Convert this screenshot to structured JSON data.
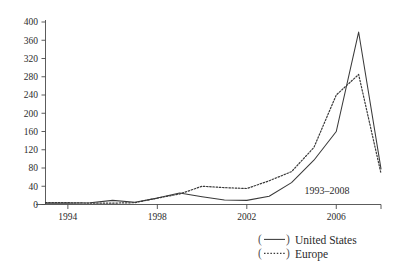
{
  "chart_data": {
    "type": "line",
    "title": "",
    "subtitle": "",
    "xlabel": "",
    "ylabel": "",
    "annotation": "1993–2008",
    "xlim": [
      1993,
      2008
    ],
    "ylim": [
      0,
      400
    ],
    "grid": false,
    "legend_position": "bottom-right",
    "x": [
      1993,
      1994,
      1995,
      1996,
      1997,
      1998,
      1999,
      2000,
      2001,
      2002,
      2003,
      2004,
      2005,
      2006,
      2007,
      2008
    ],
    "xticks": [
      1994,
      1998,
      2002,
      2006
    ],
    "xtick_labels": [
      "1994",
      "1998",
      "2002",
      "2006"
    ],
    "yticks": [
      0,
      40,
      80,
      120,
      160,
      200,
      240,
      280,
      320,
      360,
      400
    ],
    "ytick_labels": [
      "0",
      "40",
      "80",
      "120",
      "160",
      "200",
      "240",
      "280",
      "320",
      "360",
      "400"
    ],
    "series": [
      {
        "name": "United States",
        "style": "solid",
        "legend_label": "United States",
        "legend_marker": "(——)",
        "color": "#3a3a3a",
        "values": [
          3,
          3,
          4,
          9,
          5,
          14,
          25,
          17,
          10,
          9,
          18,
          48,
          97,
          160,
          378,
          78
        ]
      },
      {
        "name": "Europe",
        "style": "dotted",
        "legend_label": "Europe",
        "legend_marker": "(·····)",
        "color": "#3a3a3a",
        "values": [
          4,
          4,
          3,
          3,
          4,
          14,
          23,
          40,
          37,
          35,
          52,
          72,
          125,
          240,
          285,
          68
        ]
      }
    ]
  },
  "legend": {
    "entries": [
      {
        "marker": "(——)",
        "label": "United States"
      },
      {
        "marker": "(·····)",
        "label": "Europe"
      }
    ]
  },
  "annotation": {
    "range_label": "1993–2008"
  }
}
